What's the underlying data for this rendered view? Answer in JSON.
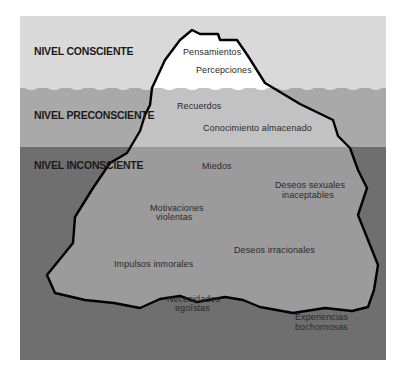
{
  "diagram": {
    "type": "iceberg",
    "colors": {
      "conscious_bg": "#d9d9d9",
      "preconscious_bg": "#a9a9a9",
      "unconscious_bg": "#6f6f6f",
      "ice_above": "#ffffff",
      "ice_preconscious": "#c2c2c2",
      "ice_unconscious": "#9b9b9b",
      "outline": "#000000"
    },
    "levels": [
      {
        "id": "conscious",
        "label": "NIVEL CONSCIENTE"
      },
      {
        "id": "preconscious",
        "label": "NIVEL PRECONSCIENTE"
      },
      {
        "id": "unconscious",
        "label": "NIVEL INCONSCIENTE"
      }
    ],
    "conscious_items": [
      "Pensamientos",
      "Percepciones"
    ],
    "preconscious_items": [
      "Recuerdos",
      "Conocimiento almacenado"
    ],
    "unconscious_items": [
      {
        "lines": [
          "Miedos"
        ]
      },
      {
        "lines": [
          "Deseos sexuales",
          "inaceptables"
        ]
      },
      {
        "lines": [
          "Motivaciones",
          "violentas"
        ]
      },
      {
        "lines": [
          "Deseos irracionales"
        ]
      },
      {
        "lines": [
          "Impulsos inmorales"
        ]
      },
      {
        "lines": [
          "Necesidades",
          "egoístas"
        ]
      },
      {
        "lines": [
          "Experiencias",
          "bochornosas"
        ]
      }
    ]
  }
}
